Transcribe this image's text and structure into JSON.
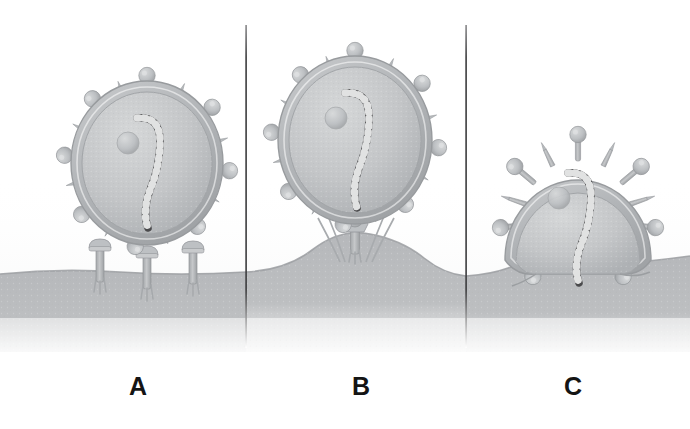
{
  "figure": {
    "background_color": "#ffffff",
    "width": 690,
    "height": 429,
    "type": "scientific-illustration"
  },
  "panels": [
    {
      "id": "A",
      "label": "A",
      "stage_name": "attachment",
      "description": "Enveloped virion bound to multiple cell-surface receptors on a flat plasma membrane",
      "virion": {
        "center_x": 147,
        "center_y": 163,
        "radius_x": 76,
        "radius_y": 82,
        "spike_count": 20,
        "receptor_contacts": 3
      },
      "membrane": {
        "shape": "flat",
        "top_y": 272
      }
    },
    {
      "id": "B",
      "label": "B",
      "stage_name": "receptor-clustering-and-membrane-deformation",
      "description": "Virion tethered to a single clustered receptor complex over a raised membrane hump",
      "virion": {
        "center_x": 355,
        "center_y": 140,
        "radius_x": 77,
        "radius_y": 84,
        "spike_count": 20,
        "receptor_contacts": 1
      },
      "membrane": {
        "shape": "raised-hump",
        "crest_y": 234
      }
    },
    {
      "id": "C",
      "label": "C",
      "stage_name": "membrane-fusion",
      "description": "Viral envelope fused with the plasma membrane, nucleocapsid entering the cell",
      "virion": {
        "center_x": 578,
        "center_y": 218,
        "radius_x": 73,
        "radius_y": 80,
        "spike_count": 18,
        "receptor_contacts": 0
      },
      "membrane": {
        "shape": "fused-continuous",
        "top_y": 268
      }
    }
  ],
  "dividers": [
    {
      "x": 246,
      "y_top": 25,
      "y_bottom": 348
    },
    {
      "x": 466,
      "y_top": 25,
      "y_bottom": 348
    }
  ],
  "components": {
    "envelope_label": "viral envelope",
    "spike_label": "glycoprotein spike",
    "nucleocapsid_label": "helical nucleocapsid",
    "receptor_label": "cell-surface receptor",
    "membrane_label": "plasma membrane",
    "cytoplasm_label": "cytoplasm"
  },
  "colors": {
    "background": "#ffffff",
    "membrane_fill": "#b9bbbd",
    "membrane_edge": "#9ea1a4",
    "envelope_outer": "#b4b7ba",
    "envelope_inner": "#c6c8ca",
    "virion_interior": "#c3c5c7",
    "spike_fill": "#bcbfc2",
    "spike_stroke": "#9a9da0",
    "nucleocapsid_dark": "#4a4a4c",
    "nucleocapsid_beads": "#e9eaea",
    "receptor_fill": "#b2b5b8",
    "divider_line": "#3c3c3e",
    "label_text": "#141414"
  }
}
